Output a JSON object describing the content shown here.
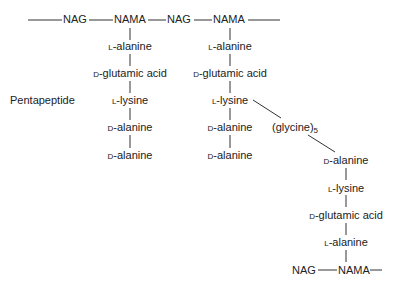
{
  "diagram": {
    "type": "peptidoglycan cross-link structure",
    "backbone_top": [
      "NAG",
      "NAMA",
      "NAG",
      "NAMA"
    ],
    "side_label": "Pentapeptide",
    "chain_left": [
      {
        "prefix": "L",
        "name": "-alanine"
      },
      {
        "prefix": "D",
        "name": "-glutamic acid"
      },
      {
        "prefix": "L",
        "name": "-lysine"
      },
      {
        "prefix": "D",
        "name": "-alanine"
      },
      {
        "prefix": "D",
        "name": "-alanine"
      }
    ],
    "chain_middle": [
      {
        "prefix": "L",
        "name": "-alanine"
      },
      {
        "prefix": "D",
        "name": "-glutamic acid"
      },
      {
        "prefix": "L",
        "name": "-lysine"
      },
      {
        "prefix": "D",
        "name": "-alanine"
      },
      {
        "prefix": "D",
        "name": "-alanine"
      }
    ],
    "bridge": {
      "name": "(glycine)",
      "subscript": "5"
    },
    "chain_right": [
      {
        "prefix": "D",
        "name": "-alanine"
      },
      {
        "prefix": "L",
        "name": "-lysine"
      },
      {
        "prefix": "D",
        "name": "-glutamic acid"
      },
      {
        "prefix": "L",
        "name": "-alanine"
      }
    ],
    "backbone_bottom": [
      "NAG",
      "NAMA"
    ]
  }
}
